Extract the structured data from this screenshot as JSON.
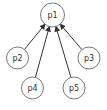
{
  "diagram": {
    "type": "tree",
    "nodes": [
      {
        "id": "p1",
        "label": "p1",
        "x": 52.5,
        "y": 15,
        "r": 12
      },
      {
        "id": "p2",
        "label": "p2",
        "x": 17.5,
        "y": 58,
        "r": 11
      },
      {
        "id": "p3",
        "label": "p3",
        "x": 89,
        "y": 58,
        "r": 11
      },
      {
        "id": "p4",
        "label": "p4",
        "x": 32.5,
        "y": 88,
        "r": 11
      },
      {
        "id": "p5",
        "label": "p5",
        "x": 74,
        "y": 88,
        "r": 11
      }
    ],
    "edges": [
      {
        "from": "p2",
        "to": "p1"
      },
      {
        "from": "p4",
        "to": "p1"
      },
      {
        "from": "p5",
        "to": "p1"
      },
      {
        "from": "p3",
        "to": "p1"
      }
    ]
  }
}
